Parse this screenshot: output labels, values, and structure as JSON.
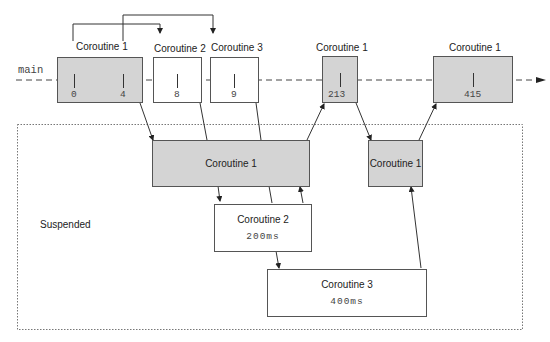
{
  "thread": {
    "label": "main"
  },
  "top_boxes": [
    {
      "id": "c1a",
      "title": "Coroutine 1",
      "ticks": [
        "0",
        "4"
      ],
      "fill": "gray"
    },
    {
      "id": "c2",
      "title": "Coroutine 2",
      "ticks": [
        "8"
      ],
      "fill": "white"
    },
    {
      "id": "c3",
      "title": "Coroutine 3",
      "ticks": [
        "9"
      ],
      "fill": "white"
    },
    {
      "id": "c1b",
      "title": "Coroutine 1",
      "ticks": [
        "213"
      ],
      "fill": "gray"
    },
    {
      "id": "c1c",
      "title": "Coroutine 1",
      "ticks": [
        "415"
      ],
      "fill": "gray"
    }
  ],
  "suspended": {
    "label": "Suspended",
    "boxes": [
      {
        "id": "s-c1a",
        "title": "Coroutine 1",
        "fill": "gray"
      },
      {
        "id": "s-c1b",
        "title": "Coroutine 1",
        "fill": "gray"
      },
      {
        "id": "s-c2",
        "title": "Coroutine 2",
        "delay": "200ms",
        "fill": "white"
      },
      {
        "id": "s-c3",
        "title": "Coroutine 3",
        "delay": "400ms",
        "fill": "white"
      }
    ]
  },
  "colors": {
    "gray_fill": "#d4d4d4",
    "border": "#555555",
    "line": "#333333"
  }
}
